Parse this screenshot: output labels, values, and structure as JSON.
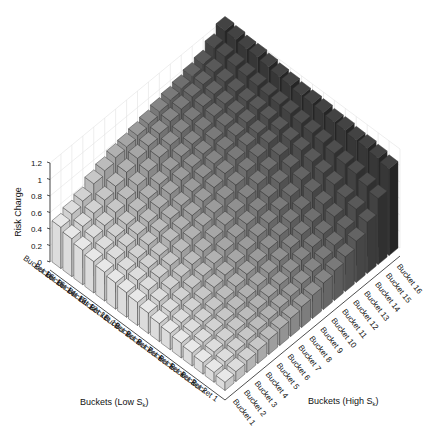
{
  "chart_data": {
    "type": "bar3d",
    "title": "",
    "zlabel": "Risk Charge",
    "xlabel": "Buckets (Low S_k)",
    "ylabel": "Buckets (High S_k)",
    "zlim": [
      0,
      1.2
    ],
    "zticks": [
      "0",
      "0.2",
      "0.4",
      "0.6",
      "0.8",
      "1",
      "1.2"
    ],
    "x_categories": [
      "Bucket 1",
      "Bucket 2",
      "Bucket 3",
      "Bucket 4",
      "Bucket 5",
      "Bucket 6",
      "Bucket 7",
      "Bucket 8",
      "Bucket 9",
      "Bucket 10",
      "Bucket 11",
      "Bucket 12",
      "Bucket 13",
      "Bucket 14",
      "Bucket 15",
      "Bucket 16"
    ],
    "y_categories": [
      "Bucket 1",
      "Bucket 2",
      "Bucket 3",
      "Bucket 4",
      "Bucket 5",
      "Bucket 6",
      "Bucket 7",
      "Bucket 8",
      "Bucket 9",
      "Bucket 10",
      "Bucket 11",
      "Bucket 12",
      "Bucket 13",
      "Bucket 14",
      "Bucket 15",
      "Bucket 16"
    ],
    "grid": true,
    "colormap": "gray (light for High bucket 1, dark for High bucket 16)",
    "values_note": "rows = Low S_k bucket 1..16, columns = High S_k bucket 1..16 (approximate, read from 3D view)",
    "values": [
      [
        0.1,
        0.12,
        0.14,
        0.16,
        0.18,
        0.2,
        0.22,
        0.25,
        0.28,
        0.32,
        0.36,
        0.42,
        0.5,
        0.62,
        0.8,
        1.05
      ],
      [
        0.12,
        0.14,
        0.16,
        0.18,
        0.2,
        0.22,
        0.25,
        0.28,
        0.32,
        0.36,
        0.4,
        0.46,
        0.55,
        0.68,
        0.85,
        1.08
      ],
      [
        0.14,
        0.16,
        0.18,
        0.2,
        0.22,
        0.25,
        0.28,
        0.32,
        0.36,
        0.4,
        0.45,
        0.5,
        0.6,
        0.72,
        0.9,
        1.1
      ],
      [
        0.16,
        0.18,
        0.2,
        0.22,
        0.25,
        0.28,
        0.32,
        0.36,
        0.4,
        0.45,
        0.5,
        0.55,
        0.65,
        0.78,
        0.92,
        1.1
      ],
      [
        0.18,
        0.2,
        0.22,
        0.25,
        0.28,
        0.32,
        0.36,
        0.4,
        0.45,
        0.5,
        0.55,
        0.6,
        0.7,
        0.82,
        0.95,
        1.12
      ],
      [
        0.2,
        0.22,
        0.25,
        0.28,
        0.32,
        0.36,
        0.4,
        0.45,
        0.5,
        0.55,
        0.6,
        0.66,
        0.75,
        0.86,
        0.98,
        1.12
      ],
      [
        0.22,
        0.25,
        0.28,
        0.32,
        0.36,
        0.4,
        0.45,
        0.5,
        0.55,
        0.6,
        0.66,
        0.72,
        0.8,
        0.9,
        1.0,
        1.14
      ],
      [
        0.25,
        0.28,
        0.32,
        0.36,
        0.4,
        0.45,
        0.5,
        0.55,
        0.6,
        0.66,
        0.72,
        0.78,
        0.85,
        0.92,
        1.02,
        1.15
      ],
      [
        0.28,
        0.32,
        0.36,
        0.4,
        0.45,
        0.5,
        0.55,
        0.6,
        0.66,
        0.72,
        0.78,
        0.84,
        0.9,
        0.95,
        1.04,
        1.15
      ],
      [
        0.3,
        0.34,
        0.38,
        0.42,
        0.48,
        0.52,
        0.58,
        0.64,
        0.7,
        0.76,
        0.82,
        0.88,
        0.92,
        0.98,
        1.05,
        1.17
      ],
      [
        0.32,
        0.36,
        0.4,
        0.45,
        0.5,
        0.55,
        0.6,
        0.66,
        0.72,
        0.78,
        0.84,
        0.9,
        0.95,
        1.0,
        1.06,
        1.18
      ],
      [
        0.35,
        0.4,
        0.44,
        0.48,
        0.52,
        0.58,
        0.64,
        0.7,
        0.75,
        0.8,
        0.86,
        0.92,
        0.96,
        1.0,
        1.08,
        1.2
      ],
      [
        0.38,
        0.42,
        0.46,
        0.5,
        0.55,
        0.6,
        0.66,
        0.72,
        0.78,
        0.82,
        0.88,
        0.94,
        0.98,
        1.02,
        1.1,
        1.22
      ],
      [
        0.42,
        0.46,
        0.5,
        0.55,
        0.6,
        0.66,
        0.72,
        0.78,
        0.82,
        0.86,
        0.9,
        0.96,
        1.0,
        1.04,
        1.12,
        1.22
      ],
      [
        0.46,
        0.5,
        0.55,
        0.6,
        0.66,
        0.72,
        0.78,
        0.82,
        0.86,
        0.9,
        0.94,
        0.98,
        1.02,
        1.06,
        1.14,
        1.24
      ],
      [
        0.5,
        0.55,
        0.6,
        0.7,
        0.75,
        0.8,
        0.82,
        0.85,
        0.88,
        0.92,
        0.95,
        0.98,
        1.02,
        1.06,
        1.15,
        1.25
      ]
    ]
  }
}
